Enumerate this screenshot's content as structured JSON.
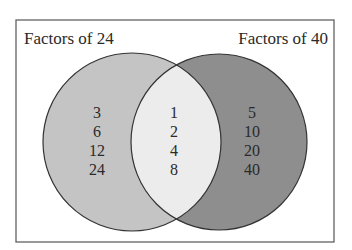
{
  "diagram": {
    "type": "venn",
    "left_set": {
      "title": "Factors of 24",
      "only": [
        "3",
        "6",
        "12",
        "24"
      ],
      "color": "#c4c4c4"
    },
    "right_set": {
      "title": "Factors of 40",
      "only": [
        "5",
        "10",
        "20",
        "40"
      ],
      "color": "#8e8e8e"
    },
    "intersection": {
      "items": [
        "1",
        "2",
        "4",
        "8"
      ],
      "color": "#ececec"
    },
    "frame_color": "#555555"
  }
}
